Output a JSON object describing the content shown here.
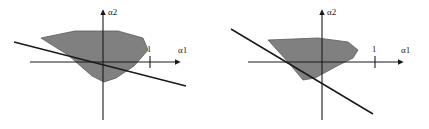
{
  "figure": {
    "background_color": "#ffffff",
    "stroke_color": "#1a1a1a",
    "region_fill_color": "#808080",
    "region_edge_color": "#5a5a5a",
    "panels": [
      {
        "id": "left",
        "name": "left-panel",
        "axes": {
          "x_axis_label": "α1",
          "y_axis_label": "α2",
          "x_tick_label": "1",
          "x_tick_value": 1,
          "origin": {
            "x": 103,
            "y": 62
          },
          "x_axis_start": {
            "x": 30,
            "y": 62
          },
          "x_axis_end": {
            "x": 176,
            "y": 62
          },
          "y_axis_start": {
            "x": 103,
            "y": 120
          },
          "y_axis_end": {
            "x": 103,
            "y": 14
          },
          "x_tick_position": {
            "x": 150,
            "y": 62
          }
        },
        "constraint_line": {
          "name": "constraint-line",
          "start": {
            "x": 14,
            "y": 42
          },
          "end": {
            "x": 186,
            "y": 86
          },
          "slope": -0.256
        },
        "feasible_region": {
          "name": "feasible-region",
          "vertices": [
            {
              "x": 41,
              "y": 38
            },
            {
              "x": 75,
              "y": 31
            },
            {
              "x": 118,
              "y": 31
            },
            {
              "x": 143,
              "y": 38
            },
            {
              "x": 148,
              "y": 50
            },
            {
              "x": 134,
              "y": 66
            },
            {
              "x": 116,
              "y": 78
            },
            {
              "x": 104,
              "y": 82
            },
            {
              "x": 92,
              "y": 76
            },
            {
              "x": 68,
              "y": 55
            }
          ]
        }
      },
      {
        "id": "right",
        "name": "right-panel",
        "axes": {
          "x_axis_label": "α1",
          "y_axis_label": "α2",
          "x_tick_label": "1",
          "x_tick_value": 1,
          "origin": {
            "x": 322,
            "y": 62
          },
          "x_axis_start": {
            "x": 248,
            "y": 62
          },
          "x_axis_end": {
            "x": 399,
            "y": 62
          },
          "y_axis_start": {
            "x": 322,
            "y": 120
          },
          "y_axis_end": {
            "x": 322,
            "y": 14
          },
          "x_tick_position": {
            "x": 375,
            "y": 62
          }
        },
        "constraint_line": {
          "name": "constraint-line",
          "start": {
            "x": 231,
            "y": 29
          },
          "end": {
            "x": 373,
            "y": 114
          },
          "slope": 0.599
        },
        "feasible_region": {
          "name": "feasible-region",
          "vertices": [
            {
              "x": 268,
              "y": 40
            },
            {
              "x": 318,
              "y": 38
            },
            {
              "x": 348,
              "y": 42
            },
            {
              "x": 358,
              "y": 50
            },
            {
              "x": 353,
              "y": 58
            },
            {
              "x": 337,
              "y": 66
            },
            {
              "x": 315,
              "y": 78
            },
            {
              "x": 303,
              "y": 80
            },
            {
              "x": 288,
              "y": 62
            }
          ]
        }
      }
    ]
  }
}
